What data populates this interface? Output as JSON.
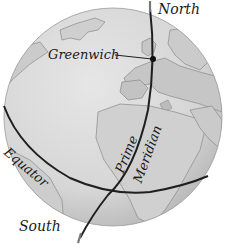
{
  "figure": {
    "type": "globe-diagram",
    "labels": {
      "north": "North",
      "south": "South",
      "greenwich": "Greenwich",
      "equator": "Equator",
      "prime": "Prime",
      "meridian": "Meridian"
    },
    "colors": {
      "background": "#ffffff",
      "ocean": "#d9d9d9",
      "land": "#c4c4c4",
      "coastline": "#8a8a8a",
      "lines": "#1f1f1f",
      "text": "#1a1a1a"
    }
  }
}
